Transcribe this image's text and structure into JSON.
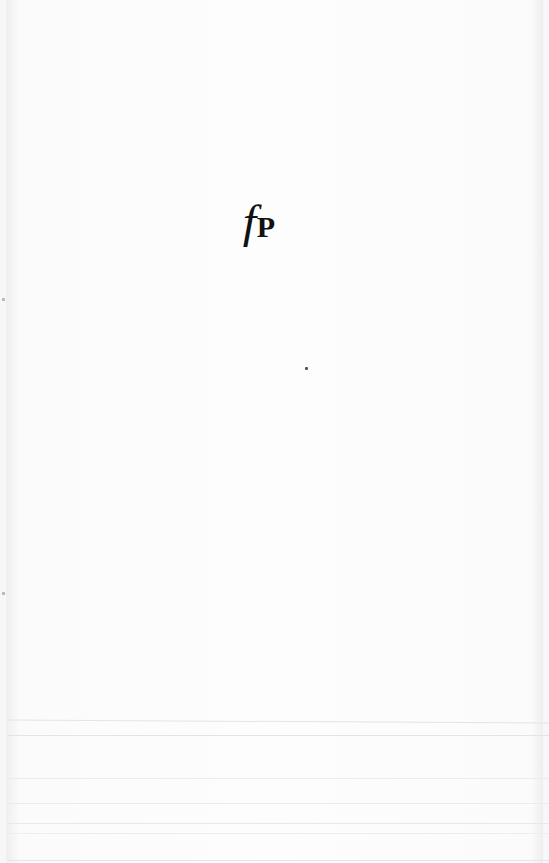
{
  "page": {
    "type": "blank-title-page",
    "logo": {
      "italic_letter": "f",
      "bold_letter": "P"
    }
  }
}
